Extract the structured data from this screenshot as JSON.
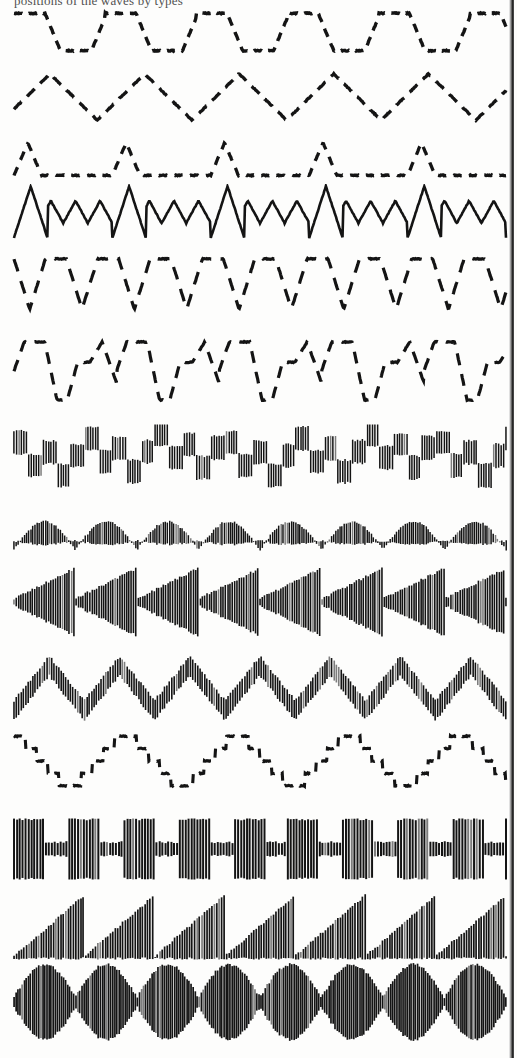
{
  "plate": {
    "width": 517,
    "height": 1058,
    "background_color": "#fdfdfc",
    "ink_color": "#141414",
    "caption_clipped_text": "positions of the waves by types",
    "gutter": {
      "x": 509,
      "width": 5,
      "color": "#1b1b1b"
    },
    "row_count": 14
  },
  "chart_data": {
    "type": "line",
    "xlabel": "",
    "ylabel": "",
    "grid": false,
    "legend": "none",
    "x": [
      0,
      100
    ],
    "series": [
      {
        "name": "Trapezoidal dashed wave",
        "index": 1,
        "render": "stroke",
        "y_top": 8,
        "height": 48,
        "cycles": 5.4,
        "amplitude": 0.78,
        "dash": "9 7",
        "stroke_width": 3.4,
        "shape": "trapezoid",
        "duty": 0.34,
        "ramp": 0.17
      },
      {
        "name": "Triangle dashed wave",
        "index": 2,
        "render": "stroke",
        "y_top": 68,
        "height": 58,
        "cycles": 5.2,
        "amplitude": 0.8,
        "dash": "11 8",
        "stroke_width": 3.3,
        "shape": "triangle",
        "phase": 0.12
      },
      {
        "name": "Narrow positive spike train",
        "index": 3,
        "render": "stroke",
        "y_top": 140,
        "height": 38,
        "cycles": 5.0,
        "amplitude": 0.86,
        "dash": "9 8",
        "stroke_width": 3.3,
        "shape": "spike-up",
        "spike_width": 0.14
      },
      {
        "name": "Amplitude modulated triangle wave",
        "index": 4,
        "render": "stroke",
        "y_top": 184,
        "height": 56,
        "cycles": 5.0,
        "sub_cycles": 4,
        "amplitude": 0.92,
        "sub_amplitude": 0.4,
        "dash": "none",
        "stroke_width": 2.6,
        "shape": "triangle-modulated"
      },
      {
        "name": "Inverted pulse wave with V dips",
        "index": 5,
        "render": "stroke",
        "y_top": 254,
        "height": 60,
        "cycles": 9.4,
        "amplitude": 0.84,
        "dash": "13 10",
        "stroke_width": 3.2,
        "shape": "spike-down",
        "spike_width": 0.3
      },
      {
        "name": "Alternating peak and valley wave",
        "index": 6,
        "render": "stroke",
        "y_top": 338,
        "height": 66,
        "cycles": 4.8,
        "amplitude": 0.88,
        "dash": "12 9",
        "stroke_width": 3.2,
        "shape": "peak-valley"
      },
      {
        "name": "Hatched carrier with square staircase envelope",
        "index": 7,
        "render": "hatch",
        "y_top": 424,
        "height": 66,
        "carrier_lines": 200,
        "envelope": "random-square",
        "envelope_cycles": 7,
        "amplitude": 0.8,
        "stroke_width": 1.5,
        "baseline": 0.55
      },
      {
        "name": "Hatched carrier with sine arch envelope",
        "index": 8,
        "render": "hatch",
        "y_top": 502,
        "height": 62,
        "carrier_lines": 235,
        "envelope": "sine-arch",
        "envelope_cycles": 8,
        "amplitude": 0.72,
        "stroke_width": 1.5,
        "baseline": 0.5
      },
      {
        "name": "Hatched carrier with reverse sawtooth arrowhead envelope",
        "index": 9,
        "render": "hatch",
        "y_top": 566,
        "height": 72,
        "carrier_lines": 215,
        "envelope": "arrowhead",
        "envelope_cycles": 8,
        "amplitude": 0.94,
        "stroke_width": 1.6,
        "baseline": 0.5
      },
      {
        "name": "Hatched carrier with triangle envelope",
        "index": 10,
        "render": "hatch",
        "y_top": 652,
        "height": 72,
        "carrier_lines": 210,
        "envelope": "triangle",
        "envelope_cycles": 7,
        "amplitude": 0.8,
        "stroke_width": 1.6,
        "baseline": 0.62
      },
      {
        "name": "Stepped staircase sine wave",
        "index": 11,
        "render": "stroke",
        "y_top": 730,
        "height": 62,
        "cycles": 4.4,
        "amplitude": 0.8,
        "dash": "9 7",
        "stroke_width": 3.1,
        "shape": "staircase-sine",
        "steps": 10
      },
      {
        "name": "Square wave burst modulation",
        "index": 12,
        "render": "hatch",
        "y_top": 818,
        "height": 62,
        "carrier_lines": 170,
        "envelope": "square-burst",
        "envelope_cycles": 9,
        "amplitude": 0.96,
        "low_amplitude": 0.22,
        "stroke_width": 2.0,
        "baseline": 0.5
      },
      {
        "name": "Sawtooth ramp envelope carrier",
        "index": 13,
        "render": "hatch",
        "y_top": 888,
        "height": 72,
        "carrier_lines": 200,
        "envelope": "sawtooth",
        "envelope_cycles": 7,
        "amplitude": 0.92,
        "stroke_width": 1.7,
        "baseline": 0.92
      },
      {
        "name": "Amplitude modulated beat pattern",
        "index": 14,
        "render": "hatch",
        "y_top": 962,
        "height": 80,
        "carrier_lines": 240,
        "envelope": "beat",
        "envelope_cycles": 8,
        "amplitude": 0.94,
        "min_amplitude": 0.12,
        "stroke_width": 1.7,
        "baseline": 0.5
      }
    ]
  }
}
